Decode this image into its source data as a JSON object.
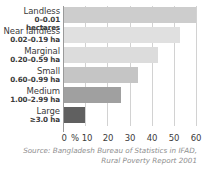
{
  "chart_data": {
    "type": "bar",
    "orientation": "horizontal",
    "title": "",
    "subtitle": "",
    "xlabel": "%",
    "ylabel": "",
    "xlim": [
      0,
      60
    ],
    "xticks": [
      0,
      10,
      20,
      30,
      40,
      50,
      60
    ],
    "xtick_labels": [
      "0",
      "10",
      "20",
      "30",
      "40",
      "50",
      "60"
    ],
    "percent_symbol": "%",
    "grid": true,
    "grid_axis": "x",
    "legend": "none",
    "categories": [
      "Landless",
      "Near landless",
      "Marginal",
      "Small",
      "Medium",
      "Large"
    ],
    "category_ranges": [
      "0–0.01 hectares",
      "0.02–0.19 ha",
      "0.20–0.59 ha",
      "0.60–0.99 ha",
      "1.00–2.99 ha",
      "≥3.0 ha"
    ],
    "values": [
      60,
      53,
      43,
      34,
      26,
      10
    ],
    "bar_colors": [
      "#cdcdcd",
      "#e0e0e0",
      "#dcdcdc",
      "#c5c5c5",
      "#a0a0a0",
      "#606060"
    ],
    "annotations": []
  },
  "caption": {
    "line1": "Source: Bangladesh Bureau of Statistics in IFAD,",
    "line2": "Rural Poverty Report 2001"
  },
  "style": {
    "background": "#ffffff",
    "grid_color": "#d2d2d2",
    "axis_color": "#9a9a9a",
    "text_color": "#3b3b3b",
    "caption_color": "#8e8e8e"
  }
}
